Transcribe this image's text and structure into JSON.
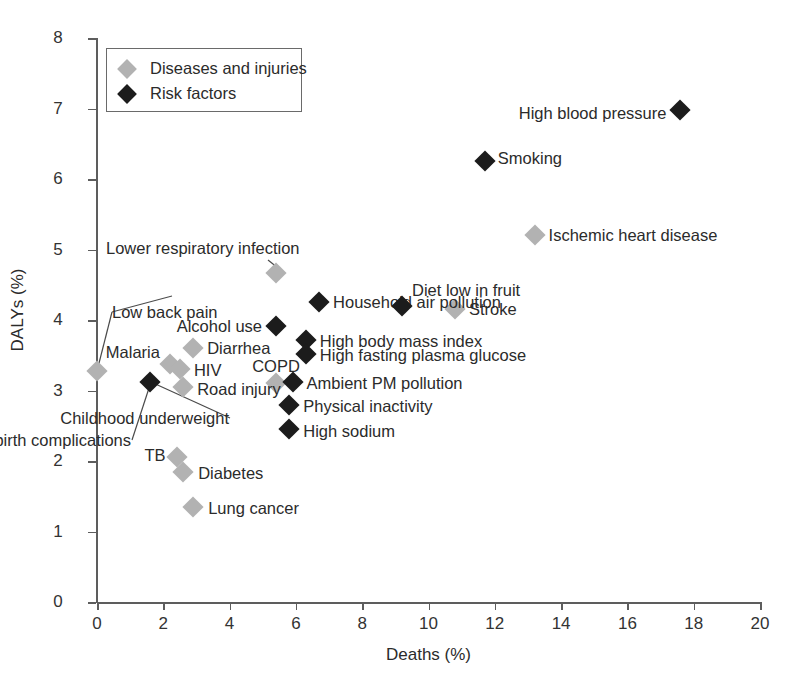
{
  "chart_data": {
    "type": "scatter",
    "title": "",
    "xlabel": "Deaths (%)",
    "ylabel": "DALYs (%)",
    "xlim": [
      0,
      20
    ],
    "ylim": [
      0,
      8
    ],
    "xticks": [
      0,
      2,
      4,
      6,
      8,
      10,
      12,
      14,
      16,
      18,
      20
    ],
    "yticks": [
      0,
      1,
      2,
      3,
      4,
      5,
      6,
      7,
      8
    ],
    "grid": false,
    "legend_position": "top-left",
    "colors": {
      "diseases_and_injuries": "#b2b2b2",
      "risk_factors": "#1c1c1c",
      "axis": "#5d5d5d",
      "text": "#2b2b2b",
      "background": "#ffffff"
    },
    "legend": [
      {
        "label": "Diseases and injuries",
        "color": "#b2b2b2",
        "marker": "diamond"
      },
      {
        "label": "Risk factors",
        "color": "#1c1c1c",
        "marker": "diamond"
      }
    ],
    "series": [
      {
        "name": "Diseases and injuries",
        "color": "#b2b2b2",
        "points": [
          {
            "label": "Ischemic heart disease",
            "x": 13.2,
            "y": 5.2,
            "label_pos": "right"
          },
          {
            "label": "Stroke",
            "x": 10.8,
            "y": 4.15,
            "label_pos": "right"
          },
          {
            "label": "Lower respiratory infection",
            "x": 5.4,
            "y": 4.67,
            "label_pos": "leader"
          },
          {
            "label": "Low back pain",
            "x": 0.0,
            "y": 3.27,
            "label_pos": "leader"
          },
          {
            "label": "Diarrhea",
            "x": 2.9,
            "y": 3.6,
            "label_pos": "right"
          },
          {
            "label": "Malaria",
            "x": 2.2,
            "y": 3.37,
            "label_pos": "left"
          },
          {
            "label": "HIV",
            "x": 2.5,
            "y": 3.3,
            "label_pos": "right"
          },
          {
            "label": "COPD",
            "x": 5.4,
            "y": 3.1,
            "label_pos": "above"
          },
          {
            "label": "Road injury",
            "x": 2.6,
            "y": 3.05,
            "label_pos": "right"
          },
          {
            "label": "TB",
            "x": 2.4,
            "y": 2.05,
            "label_pos": "left"
          },
          {
            "label": "Diabetes",
            "x": 2.6,
            "y": 1.85,
            "label_pos": "right"
          },
          {
            "label": "Lung cancer",
            "x": 2.9,
            "y": 1.35,
            "label_pos": "right"
          }
        ]
      },
      {
        "name": "Risk factors",
        "color": "#1c1c1c",
        "points": [
          {
            "label": "High blood pressure",
            "x": 17.6,
            "y": 6.98,
            "label_pos": "left"
          },
          {
            "label": "Smoking",
            "x": 11.7,
            "y": 6.25,
            "label_pos": "right"
          },
          {
            "label": "Household air pollution",
            "x": 6.7,
            "y": 4.25,
            "label_pos": "right"
          },
          {
            "label": "Diet low in fruit",
            "x": 9.2,
            "y": 4.2,
            "label_pos": "above-right"
          },
          {
            "label": "Alcohol use",
            "x": 5.4,
            "y": 3.92,
            "label_pos": "left"
          },
          {
            "label": "High body mass index",
            "x": 6.3,
            "y": 3.72,
            "label_pos": "right"
          },
          {
            "label": "High fasting plasma glucose",
            "x": 6.3,
            "y": 3.52,
            "label_pos": "right"
          },
          {
            "label": "Ambient PM pollution",
            "x": 5.9,
            "y": 3.12,
            "label_pos": "right"
          },
          {
            "label": "Childhood underweight",
            "x": 1.6,
            "y": 3.12,
            "label_pos": "leader"
          },
          {
            "label": "Preterm birth complications",
            "x": 1.6,
            "y": 3.12,
            "label_pos": "leader2"
          },
          {
            "label": "Physical inactivity",
            "x": 5.8,
            "y": 2.8,
            "label_pos": "right"
          },
          {
            "label": "High sodium",
            "x": 5.8,
            "y": 2.45,
            "label_pos": "right"
          }
        ]
      }
    ]
  }
}
